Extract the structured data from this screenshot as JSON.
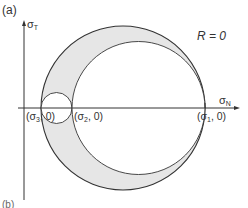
{
  "figure": {
    "panel_label": "(a)",
    "next_panel_label": "(b)",
    "annotation": "R = 0",
    "axes": {
      "y_label": "σ",
      "y_sub": "T",
      "x_label": "σ",
      "x_sub": "N"
    },
    "points": [
      {
        "label": "(σ3, 0)",
        "sym": "(σ",
        "sub": "3",
        "rest": ", 0)"
      },
      {
        "label": "(σ2, 0)",
        "sym": "(σ",
        "sub": "2",
        "rest": ", 0)"
      },
      {
        "label": "(σ1, 0)",
        "sym": "(σ",
        "sub": "1",
        "rest": ", 0)"
      }
    ],
    "circles": {
      "outer": {
        "from": "σ3",
        "to": "σ1"
      },
      "small_inner": {
        "from": "σ3",
        "to": "σ2"
      },
      "large_inner": {
        "from": "σ2",
        "to": "σ1"
      }
    },
    "colors": {
      "shade": "#e6e6e6",
      "stroke": "#333333",
      "background": "#ffffff"
    }
  }
}
